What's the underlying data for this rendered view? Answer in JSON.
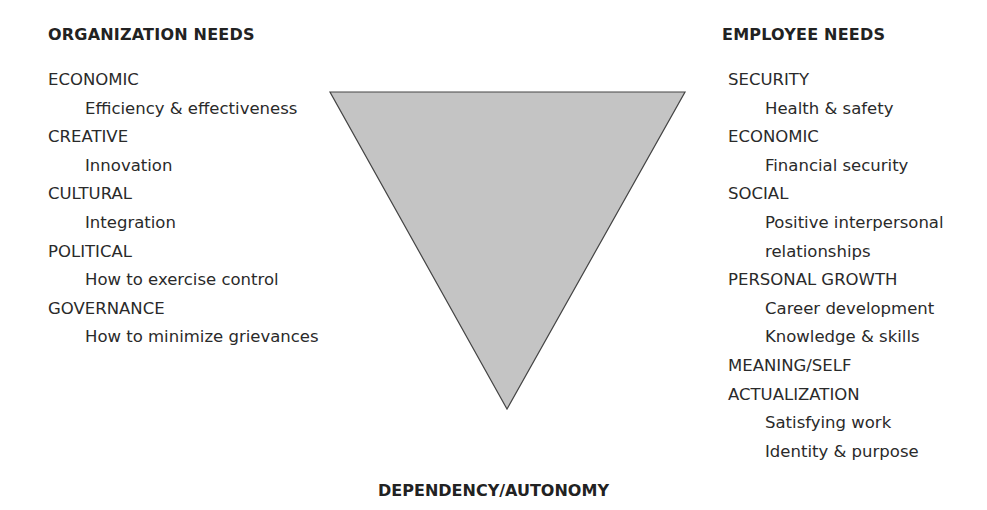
{
  "diagram": {
    "type": "inverted-triangle",
    "fill_color": "#c4c4c4",
    "stroke_color": "#444444"
  },
  "left": {
    "heading": "ORGANIZATION NEEDS",
    "groups": [
      {
        "category": "ECONOMIC",
        "items": [
          "Efficiency & effectiveness"
        ]
      },
      {
        "category": "CREATIVE",
        "items": [
          "Innovation"
        ]
      },
      {
        "category": "CULTURAL",
        "items": [
          "Integration"
        ]
      },
      {
        "category": "POLITICAL",
        "items": [
          "How to exercise control"
        ]
      },
      {
        "category": "GOVERNANCE",
        "items": [
          "How to minimize grievances"
        ]
      }
    ]
  },
  "right": {
    "heading": "EMPLOYEE NEEDS",
    "groups": [
      {
        "category": "SECURITY",
        "items": [
          "Health & safety"
        ]
      },
      {
        "category": "ECONOMIC",
        "items": [
          "Financial security"
        ]
      },
      {
        "category": "SOCIAL",
        "items": [
          "Positive interpersonal",
          "relationships"
        ]
      },
      {
        "category": "PERSONAL GROWTH",
        "items": [
          "Career development",
          "Knowledge & skills"
        ]
      },
      {
        "category": "MEANING/SELF",
        "category2": "ACTUALIZATION",
        "items": [
          "Satisfying work",
          "Identity & purpose"
        ]
      }
    ]
  },
  "bottom_label": "DEPENDENCY/AUTONOMY"
}
